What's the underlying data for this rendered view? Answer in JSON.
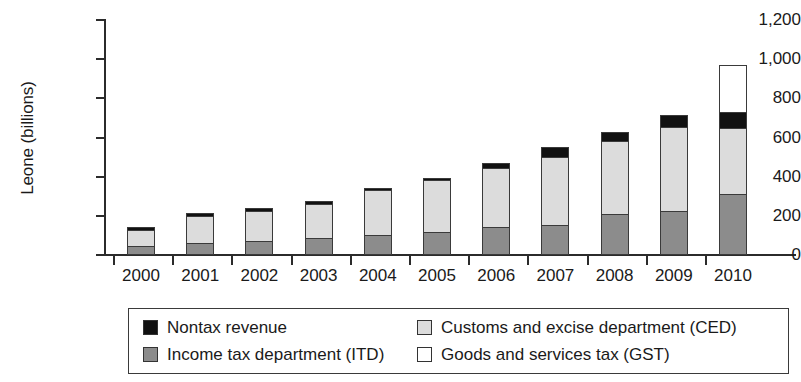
{
  "chart_data": {
    "type": "bar",
    "subtype": "stacked",
    "title": "",
    "xlabel": "",
    "ylabel": "Leone (billions)",
    "ylim": [
      0,
      1200
    ],
    "ytick_labels": [
      "1,200",
      "1,000",
      "800",
      "600",
      "400",
      "200",
      "0"
    ],
    "ytick_values": [
      1200,
      1000,
      800,
      600,
      400,
      200,
      0
    ],
    "grid": false,
    "legend_position": "bottom",
    "categories": [
      "2000",
      "2001",
      "2002",
      "2003",
      "2004",
      "2005",
      "2006",
      "2007",
      "2008",
      "2009",
      "2010"
    ],
    "series": [
      {
        "name": "Income tax department (ITD)",
        "color": "#8c8c8c",
        "values": [
          45,
          60,
          70,
          85,
          100,
          120,
          145,
          155,
          210,
          225,
          310
        ]
      },
      {
        "name": "Customs and excise department (CED)",
        "color": "#dcdcdc",
        "values": [
          85,
          140,
          155,
          175,
          230,
          265,
          300,
          345,
          370,
          430,
          340
        ]
      },
      {
        "name": "Nontax revenue",
        "color": "#111111",
        "values": [
          15,
          15,
          15,
          15,
          10,
          10,
          25,
          50,
          50,
          60,
          80
        ]
      },
      {
        "name": "Goods and services tax (GST)",
        "color": "#ffffff",
        "values": [
          0,
          0,
          0,
          0,
          0,
          0,
          0,
          0,
          0,
          0,
          240
        ]
      }
    ],
    "totals": [
      145,
      215,
      240,
      275,
      340,
      395,
      470,
      550,
      630,
      715,
      970
    ]
  },
  "legend": {
    "items": [
      {
        "label": "Nontax revenue",
        "swatch": "#111111"
      },
      {
        "label": "Income tax department (ITD)",
        "swatch": "#8c8c8c"
      },
      {
        "label": "Customs and excise department (CED)",
        "swatch": "#dcdcdc"
      },
      {
        "label": "Goods and services tax (GST)",
        "swatch": "#ffffff"
      }
    ]
  }
}
